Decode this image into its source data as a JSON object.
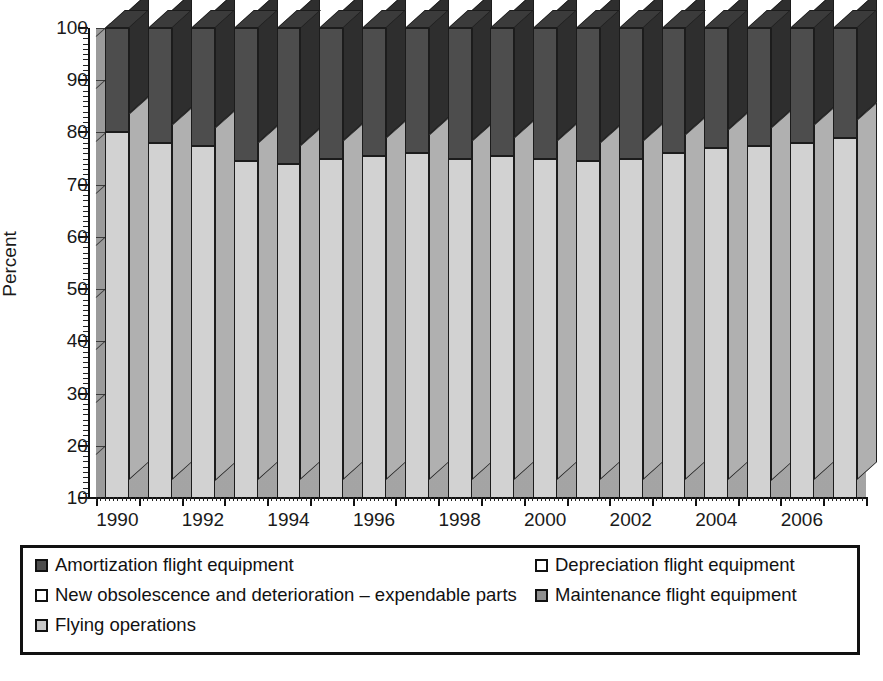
{
  "chart_data": {
    "type": "bar",
    "subtype": "stacked-column-3d",
    "title": "",
    "xlabel": "",
    "ylabel": "Percent",
    "ylim": [
      10,
      100
    ],
    "ytick_step": 10,
    "yticks": [
      10,
      20,
      30,
      40,
      50,
      60,
      70,
      80,
      90,
      100
    ],
    "grid": true,
    "legend_position": "bottom",
    "categories": [
      "1990",
      "1991",
      "1992",
      "1993",
      "1994",
      "1995",
      "1996",
      "1997",
      "1998",
      "1999",
      "2000",
      "2001",
      "2002",
      "2003",
      "2004",
      "2005",
      "2006",
      "2007"
    ],
    "xtick_labels": [
      "1990",
      "1992",
      "1994",
      "1996",
      "1998",
      "2000",
      "2002",
      "2004",
      "2006"
    ],
    "series": [
      {
        "name": "Flying operations",
        "color": "#d2d2d2",
        "swatch": "light",
        "values": [
          70.0,
          68.0,
          67.5,
          64.5,
          64.0,
          65.0,
          65.5,
          66.0,
          65.0,
          65.5,
          65.0,
          64.5,
          65.0,
          66.0,
          67.0,
          67.5,
          68.0,
          69.0
        ]
      },
      {
        "name": "Maintenance flight equipment",
        "color": "#8f8f8f",
        "swatch": "mid",
        "values": [
          0,
          0,
          0,
          0,
          0,
          0,
          0,
          0,
          0,
          0,
          0,
          0,
          0,
          0,
          0,
          0,
          0,
          0
        ]
      },
      {
        "name": "New obsolescence and deterioration – expendable parts",
        "color": "#fbfbfb",
        "swatch": "white",
        "values": [
          0,
          0,
          0,
          0,
          0,
          0,
          0,
          0,
          0,
          0,
          0,
          0,
          0,
          0,
          0,
          0,
          0,
          0
        ]
      },
      {
        "name": "Amortization flight equipment",
        "color": "#4d4d4d",
        "swatch": "dark",
        "values": [
          21.0,
          22.0,
          23.0,
          26.0,
          26.5,
          25.5,
          26.0,
          27.5,
          27.5,
          27.5,
          28.5,
          29.5,
          29.0,
          28.0,
          27.0,
          26.0,
          26.0,
          25.0
        ]
      },
      {
        "name": "Depreciation flight equipment",
        "color": "#ffffff",
        "swatch": "white",
        "values": [
          9.0,
          10.0,
          9.5,
          9.5,
          9.5,
          9.5,
          8.5,
          6.5,
          7.5,
          7.0,
          6.5,
          6.0,
          6.0,
          6.0,
          6.0,
          6.5,
          6.0,
          6.0
        ]
      }
    ],
    "stack_order_bottom_to_top": [
      "Flying operations",
      "Maintenance flight equipment",
      "New obsolescence and deterioration – expendable parts",
      "Amortization flight equipment",
      "Depreciation flight equipment"
    ]
  },
  "legend": {
    "entries": [
      {
        "label": "Amortization flight equipment",
        "swatch": "dark"
      },
      {
        "label": "Depreciation flight equipment",
        "swatch": "white"
      },
      {
        "label": "New obsolescence and deterioration – expendable parts",
        "swatch": "white"
      },
      {
        "label": "Maintenance flight equipment",
        "swatch": "mid"
      },
      {
        "label": "Flying operations",
        "swatch": "light"
      }
    ]
  }
}
